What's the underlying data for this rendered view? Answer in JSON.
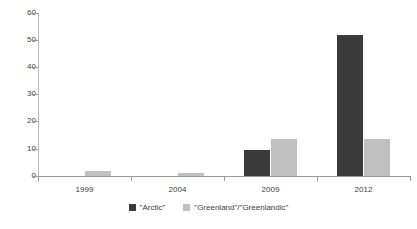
{
  "chart_data": {
    "type": "bar",
    "title": "",
    "subtitle": "",
    "xlabel": "",
    "ylabel": "",
    "categories": [
      "1999",
      "2004",
      "2009",
      "2012"
    ],
    "series": [
      {
        "name": "\"Arctic\"",
        "color": "#3a3a3a",
        "values": [
          0,
          0,
          9.5,
          52
        ]
      },
      {
        "name": "\"Greenland\"/\"Greenlandic\"",
        "color": "#c0c0c0",
        "values": [
          2,
          1,
          13.5,
          13.5
        ]
      }
    ],
    "ylim": [
      0,
      60
    ],
    "yticks": [
      0,
      10,
      20,
      30,
      40,
      50,
      60
    ],
    "ytick_labels": [
      "0",
      "10",
      "20",
      "30",
      "40",
      "50",
      "60"
    ],
    "grid": false,
    "legend_position": "bottom"
  },
  "legend": {
    "entries": [
      {
        "label": "\"Arctic\"",
        "swatch": "dark-swatch"
      },
      {
        "label": "\"Greenland\"/\"Greenlandic\"",
        "swatch": "light-swatch"
      }
    ]
  },
  "colors": {
    "series_dark": "#3a3a3a",
    "series_light": "#c0c0c0",
    "axis": "#9a9a9a",
    "text": "#3d3d3d",
    "background": "#ffffff"
  }
}
